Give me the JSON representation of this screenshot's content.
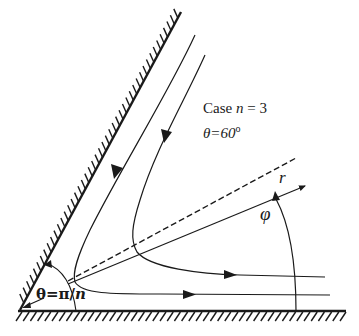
{
  "figure": {
    "case_label_prefix": "Case ",
    "case_variable": "n",
    "case_equals": " = 3",
    "angle_label": "θ=60",
    "angle_unit": "o",
    "radial_axis_label": "r",
    "polar_angle_label": "φ",
    "wedge_angle_label_prefix": "θ=π/",
    "wedge_angle_label_variable": "n"
  },
  "elements": {
    "walls": [
      "inclined-wall",
      "bottom-wall"
    ],
    "streamlines": [
      {
        "id": "streamline-inner",
        "direction": "down-then-right"
      },
      {
        "id": "streamline-outer",
        "direction": "down-then-right"
      }
    ],
    "dividing_line": "dashed",
    "axes": [
      "r-axis",
      "phi-arc",
      "theta-arc"
    ]
  },
  "colors": {
    "ink": "#1a1a1a",
    "background": "#ffffff"
  }
}
